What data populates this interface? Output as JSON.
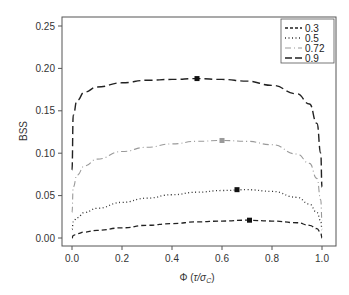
{
  "chart_data": {
    "type": "line",
    "title": "",
    "xlabel": "Φ (τ/σ_C)",
    "ylabel": "BSS",
    "xlim": [
      0.0,
      1.0
    ],
    "ylim": [
      0.0,
      0.25
    ],
    "xticks": [
      "0.0",
      "0.2",
      "0.4",
      "0.6",
      "0.8",
      "1.0"
    ],
    "yticks": [
      "0.00",
      "0.05",
      "0.10",
      "0.15",
      "0.20",
      "0.25"
    ],
    "grid": false,
    "legend_position": "upper right",
    "x": [
      0.0,
      0.005,
      0.02,
      0.05,
      0.1,
      0.2,
      0.3,
      0.4,
      0.5,
      0.6,
      0.7,
      0.8,
      0.9,
      0.95,
      0.98,
      0.995,
      1.0
    ],
    "series": [
      {
        "name": "0.3",
        "style": "dashed",
        "color": "#222222",
        "values": [
          0.0,
          0.003,
          0.005,
          0.007,
          0.009,
          0.012,
          0.015,
          0.017,
          0.019,
          0.02,
          0.021,
          0.02,
          0.018,
          0.015,
          0.011,
          0.006,
          0.0
        ],
        "max_marker": {
          "x": 0.71,
          "y": 0.021,
          "color": "#111111"
        }
      },
      {
        "name": "0.5",
        "style": "dotted",
        "color": "#333333",
        "values": [
          0.01,
          0.019,
          0.024,
          0.03,
          0.035,
          0.042,
          0.047,
          0.051,
          0.054,
          0.056,
          0.057,
          0.055,
          0.048,
          0.04,
          0.03,
          0.02,
          0.01
        ],
        "max_marker": {
          "x": 0.66,
          "y": 0.057,
          "color": "#111111"
        }
      },
      {
        "name": "0.72",
        "style": "dash-dot",
        "color": "#9a9a9a",
        "values": [
          0.03,
          0.06,
          0.074,
          0.085,
          0.093,
          0.102,
          0.107,
          0.111,
          0.114,
          0.115,
          0.114,
          0.11,
          0.099,
          0.088,
          0.07,
          0.045,
          0.02
        ],
        "max_marker": {
          "x": 0.6,
          "y": 0.115,
          "color": "#9a9a9a"
        }
      },
      {
        "name": "0.9",
        "style": "long-dashed",
        "color": "#222222",
        "values": [
          0.08,
          0.145,
          0.162,
          0.172,
          0.178,
          0.183,
          0.186,
          0.187,
          0.188,
          0.187,
          0.185,
          0.18,
          0.17,
          0.158,
          0.135,
          0.1,
          0.06
        ],
        "max_marker": {
          "x": 0.5,
          "y": 0.188,
          "color": "#111111"
        }
      }
    ]
  }
}
